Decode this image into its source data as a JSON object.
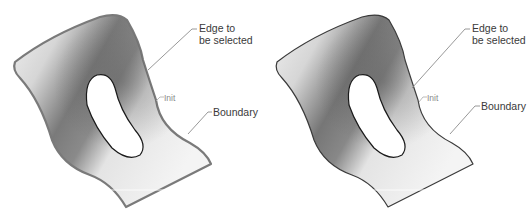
{
  "figures": [
    {
      "id": "left",
      "state": "edge highlighted",
      "labels": {
        "edge_line1": "Edge to",
        "edge_line2": "be selected",
        "init": "Init",
        "boundary": "Boundary"
      },
      "outline_color": "#7a7a7a",
      "outline_width": 2.2
    },
    {
      "id": "right",
      "state": "edge normal",
      "labels": {
        "edge_line1": "Edge to",
        "edge_line2": "be selected",
        "init": "Init",
        "boundary": "Boundary"
      },
      "outline_color": "#3a3a3a",
      "outline_width": 1.2
    }
  ],
  "colors": {
    "surface_light": "#f2f2f2",
    "surface_dark": "#6e6e6e",
    "hole_fill": "#ffffff",
    "hole_outline": "#1a1a1a",
    "leader_line": "#8c8c8c",
    "label_text": "#3a3a3a"
  }
}
